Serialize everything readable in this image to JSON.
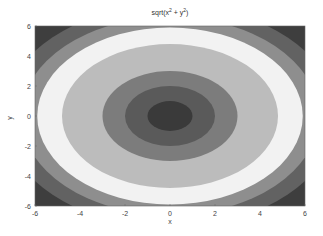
{
  "chart_data": {
    "type": "contour",
    "title_parts": {
      "base": "sqrt(x",
      "sup1": "2",
      "mid": " + y",
      "sup2": "2",
      "end": ")"
    },
    "xlabel": "x",
    "ylabel": "y",
    "xlim": [
      -6,
      6
    ],
    "ylim": [
      -6,
      6
    ],
    "xticks": [
      -6,
      -4,
      -2,
      0,
      2,
      4,
      6
    ],
    "yticks": [
      -6,
      -4,
      -2,
      0,
      2,
      4,
      6
    ],
    "function": "z = sqrt(x^2 + y^2)",
    "colormap": "gray",
    "bands": [
      {
        "r_min": 7.4,
        "r_max": 8.49,
        "color": "#3e3e3e"
      },
      {
        "r_min": 6.6,
        "r_max": 7.4,
        "color": "#626262"
      },
      {
        "r_min": 5.9,
        "r_max": 6.6,
        "color": "#8e8e8e"
      },
      {
        "r_min": 4.8,
        "r_max": 5.9,
        "color": "#f2f2f2"
      },
      {
        "r_min": 3.0,
        "r_max": 4.8,
        "color": "#bcbcbc"
      },
      {
        "r_min": 2.0,
        "r_max": 3.0,
        "color": "#7c7c7c"
      },
      {
        "r_min": 1.0,
        "r_max": 2.0,
        "color": "#5a5a5a"
      },
      {
        "r_min": 0.0,
        "r_max": 1.0,
        "color": "#3a3a3a"
      }
    ],
    "grid": false,
    "legend": null
  }
}
